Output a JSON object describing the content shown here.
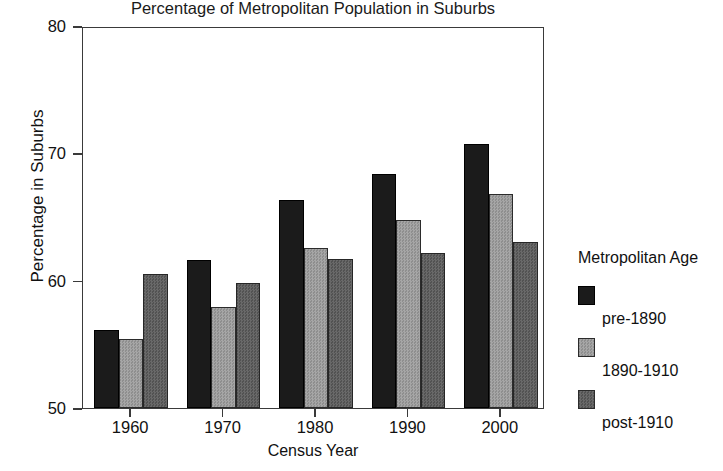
{
  "chart_data": {
    "type": "bar",
    "title": "Percentage of Metropolitan Population in Suburbs",
    "xlabel": "Census Year",
    "ylabel": "Percentage in Suburbs",
    "categories": [
      "1960",
      "1970",
      "1980",
      "1990",
      "2000"
    ],
    "series": [
      {
        "name": "pre-1890",
        "values": [
          56.1,
          61.6,
          66.3,
          68.4,
          70.7
        ],
        "color": "#1b1b1b"
      },
      {
        "name": "1890-1910",
        "values": [
          55.4,
          57.9,
          62.6,
          64.8,
          66.8
        ],
        "color": "#9a9a9a"
      },
      {
        "name": "post-1910",
        "values": [
          60.5,
          59.8,
          61.7,
          62.2,
          63.0
        ],
        "color": "#5d5d5d"
      }
    ],
    "ylim": [
      50,
      80
    ],
    "yticks": [
      50,
      60,
      70,
      80
    ],
    "ytick_labels": [
      "50",
      "60",
      "70",
      "80"
    ],
    "grid": false,
    "legend": {
      "title": "Metropolitan Age",
      "position": "right",
      "entries": [
        "pre-1890",
        "1890-1910",
        "post-1910"
      ]
    }
  }
}
